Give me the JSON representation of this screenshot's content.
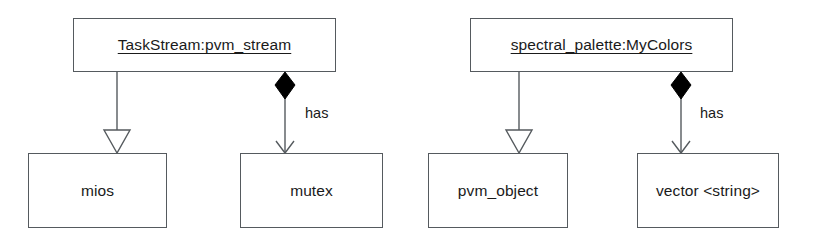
{
  "diagram": {
    "type": "uml-object-diagram",
    "background_color": "#ffffff",
    "line_color": "#555a5e",
    "text_color": "#1a1a1a",
    "fill_color": "#ffffff",
    "diamond_color": "#000000",
    "groups": [
      {
        "name": "taskstream-group",
        "parent": {
          "label": "TaskStream:pvm_stream",
          "underlined": true,
          "x": 73,
          "y": 18,
          "width": 263,
          "height": 54
        },
        "children": [
          {
            "label": "mios",
            "relation": "generalization",
            "arrowhead": "hollow-triangle",
            "edge_label": "",
            "x": 28,
            "y": 153,
            "width": 139,
            "height": 75
          },
          {
            "label": "mutex",
            "relation": "composition",
            "arrowhead": "open-arrow",
            "source_decoration": "filled-diamond",
            "edge_label": "has",
            "x": 240,
            "y": 153,
            "width": 143,
            "height": 75
          }
        ]
      },
      {
        "name": "spectral-palette-group",
        "parent": {
          "label": "spectral_palette:MyColors",
          "underlined": true,
          "x": 470,
          "y": 18,
          "width": 263,
          "height": 54
        },
        "children": [
          {
            "label": "pvm_object",
            "relation": "generalization",
            "arrowhead": "hollow-triangle",
            "edge_label": "",
            "x": 428,
            "y": 153,
            "width": 140,
            "height": 75
          },
          {
            "label": "vector <string>",
            "relation": "composition",
            "arrowhead": "open-arrow",
            "source_decoration": "filled-diamond",
            "edge_label": "has",
            "x": 637,
            "y": 153,
            "width": 142,
            "height": 75
          }
        ]
      }
    ],
    "edge_labels": [
      {
        "text": "has",
        "x": 305,
        "y": 105
      },
      {
        "text": "has",
        "x": 700,
        "y": 105
      }
    ]
  }
}
